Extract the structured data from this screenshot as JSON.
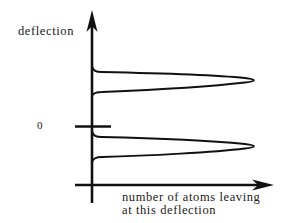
{
  "diagram": {
    "y_axis_label": "deflection",
    "x_axis_label_line1": "number of atoms leaving",
    "x_axis_label_line2": "at this deflection",
    "zero_label": "0",
    "peaks": [
      {
        "name": "upper-peak",
        "position": "above zero"
      },
      {
        "name": "lower-peak",
        "position": "below zero"
      }
    ],
    "colors": {
      "line": "#111111",
      "background": "#ffffff"
    }
  }
}
